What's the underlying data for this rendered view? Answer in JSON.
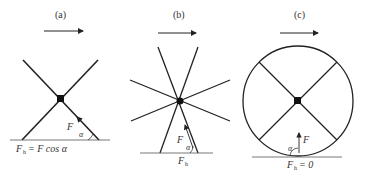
{
  "panels": [
    {
      "id": "a",
      "label": "(a)",
      "force": "F",
      "angle": "α",
      "formula_lhs": "F",
      "formula_sub": "h",
      "formula_rhs": "= F cos α"
    },
    {
      "id": "b",
      "label": "(b)",
      "force": "F",
      "angle": "α",
      "formula_lhs": "F",
      "formula_sub": "h",
      "formula_rhs": ""
    },
    {
      "id": "c",
      "label": "(c)",
      "force": "F",
      "angle": "α",
      "formula_lhs": "F",
      "formula_sub": "h",
      "formula_rhs": "= 0"
    }
  ],
  "colors": {
    "stroke": "#222222",
    "ground": "#555555"
  }
}
